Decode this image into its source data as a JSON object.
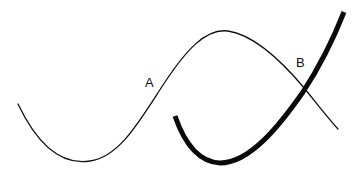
{
  "diagram": {
    "labels": {
      "a": "A",
      "b": "B"
    },
    "curves": [
      {
        "name": "thin-curve",
        "stroke": "#111111",
        "width": 1.3
      },
      {
        "name": "thick-curve",
        "stroke": "#0a0a0a",
        "width": 5
      }
    ],
    "colors": {
      "background": "#ffffff",
      "ink": "#111111"
    }
  }
}
